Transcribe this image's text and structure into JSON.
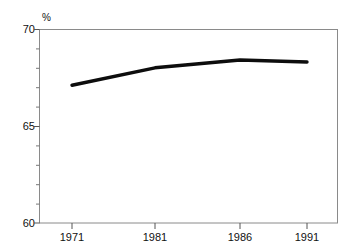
{
  "chart_data": {
    "type": "line",
    "title": "",
    "subtitle": "",
    "xlabel": "",
    "ylabel": "%",
    "unit_label": "%",
    "categories": [
      "1971",
      "1981",
      "1986",
      "1991"
    ],
    "x": [
      1971,
      1981,
      1986,
      1991
    ],
    "values": [
      67.1,
      68.0,
      68.4,
      68.3
    ],
    "series": [
      {
        "name": "",
        "values": [
          67.1,
          68.0,
          68.4,
          68.3
        ]
      }
    ],
    "ylim": [
      60,
      70
    ],
    "ytick_labels": [
      "60",
      "65",
      "70"
    ],
    "ytick_values": [
      60,
      65,
      70
    ],
    "yminor_step": 1,
    "xtick_labels": [
      "1971",
      "1981",
      "1986",
      "1991"
    ],
    "grid": false,
    "legend": false,
    "legend_position": "none",
    "line_color": "#0d0d0d",
    "frame_color": "#8a8a8a"
  },
  "figure": {
    "clipped_title_fragment": "",
    "background_color": "#ffffff"
  }
}
